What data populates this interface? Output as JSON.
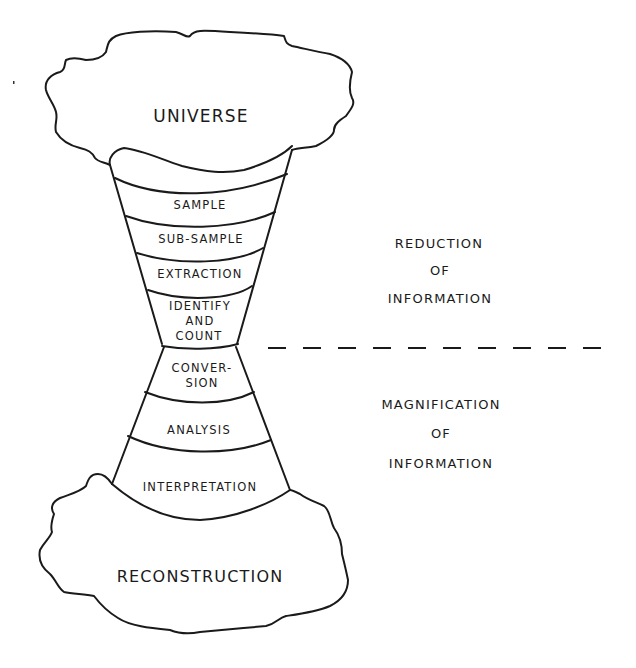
{
  "diagram": {
    "top_cloud": {
      "label": "UNIVERSE"
    },
    "bottom_cloud": {
      "label": "RECONSTRUCTION"
    },
    "funnel_stages": [
      {
        "id": "sample",
        "lines": [
          "SAMPLE"
        ]
      },
      {
        "id": "sub-sample",
        "lines": [
          "SUB-SAMPLE"
        ]
      },
      {
        "id": "extraction",
        "lines": [
          "EXTRACTION"
        ]
      },
      {
        "id": "identify-and-count",
        "lines": [
          "IDENTIFY",
          "AND",
          "COUNT"
        ]
      },
      {
        "id": "conversion",
        "lines": [
          "CONVER-",
          "SION"
        ]
      },
      {
        "id": "analysis",
        "lines": [
          "ANALYSIS"
        ]
      },
      {
        "id": "interpretation",
        "lines": [
          "INTERPRETATION"
        ]
      }
    ],
    "side_labels": {
      "reduction": [
        "REDUCTION",
        "OF",
        "INFORMATION"
      ],
      "magnification": [
        "MAGNIFICATION",
        "OF",
        "INFORMATION"
      ]
    },
    "divider": {
      "style": "dashed"
    },
    "colors": {
      "ink": "#1a1a1a",
      "background": "#ffffff"
    }
  }
}
